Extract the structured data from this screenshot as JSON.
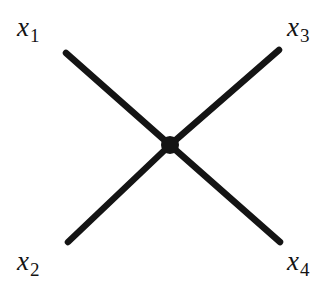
{
  "figure": {
    "background_color": "#ffffff",
    "line_color": "#141414",
    "vertex_color": "#141414",
    "width": 336,
    "height": 290
  },
  "vertex": {
    "name": "interaction-vertex",
    "x": 170,
    "y": 145,
    "radius": 9
  },
  "legs": [
    {
      "id": "leg-x1",
      "label_id": "x1",
      "x1": 170,
      "y1": 145,
      "x2": 66,
      "y2": 53,
      "stroke_width": 6.5
    },
    {
      "id": "leg-x3",
      "label_id": "x3",
      "x1": 170,
      "y1": 145,
      "x2": 279,
      "y2": 50,
      "stroke_width": 6.5
    },
    {
      "id": "leg-x2",
      "label_id": "x2",
      "x1": 170,
      "y1": 145,
      "x2": 68,
      "y2": 242,
      "stroke_width": 6.5
    },
    {
      "id": "leg-x4",
      "label_id": "x4",
      "x1": 170,
      "y1": 145,
      "x2": 280,
      "y2": 242,
      "stroke_width": 6.5
    }
  ],
  "labels": {
    "x1": {
      "symbol": "x",
      "subscript": "1",
      "text": "x1",
      "position": "top-left"
    },
    "x3": {
      "symbol": "x",
      "subscript": "3",
      "text": "x3",
      "position": "top-right"
    },
    "x2": {
      "symbol": "x",
      "subscript": "2",
      "text": "x2",
      "position": "bottom-left"
    },
    "x4": {
      "symbol": "x",
      "subscript": "4",
      "text": "x4",
      "position": "bottom-right"
    }
  }
}
